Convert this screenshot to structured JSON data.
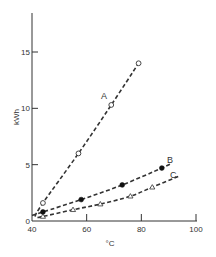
{
  "chart_data": {
    "type": "line",
    "title": "",
    "xlabel": "°C",
    "ylabel": "kWh",
    "xlim": [
      40,
      100
    ],
    "ylim": [
      0,
      18
    ],
    "xticks": [
      40,
      60,
      80,
      100
    ],
    "yticks": [
      0,
      5,
      10,
      15
    ],
    "grid": false,
    "legend": "inline labels at line ends",
    "series": [
      {
        "name": "A",
        "marker": "open-circle",
        "line_style": "dashed",
        "x": [
          44,
          57,
          69,
          79
        ],
        "y": [
          1.6,
          6.0,
          10.3,
          14.0
        ],
        "curve_x": [
          41,
          44,
          57,
          69,
          79
        ],
        "curve_y": [
          0.4,
          1.6,
          6.0,
          10.3,
          14.0
        ]
      },
      {
        "name": "B",
        "marker": "filled-circle",
        "line_style": "dashed",
        "x": [
          44,
          58,
          73,
          87.5
        ],
        "y": [
          0.8,
          1.9,
          3.2,
          4.7
        ],
        "curve_x": [
          40,
          44,
          58,
          73,
          87.5,
          91
        ],
        "curve_y": [
          0.5,
          0.8,
          1.9,
          3.2,
          4.7,
          5.1
        ]
      },
      {
        "name": "C",
        "marker": "open-triangle",
        "line_style": "dashed",
        "x": [
          44,
          55,
          65,
          76,
          84
        ],
        "y": [
          0.4,
          1.0,
          1.5,
          2.2,
          3.0
        ],
        "curve_x": [
          42,
          44,
          55,
          65,
          76,
          84,
          94
        ],
        "curve_y": [
          0.3,
          0.4,
          1.0,
          1.5,
          2.2,
          3.0,
          4.0
        ]
      }
    ]
  },
  "labels": {
    "x_axis": "°C",
    "y_axis": "kWh",
    "series_A": "A",
    "series_B": "B",
    "series_C": "C",
    "x_ticks": [
      "40",
      "60",
      "80",
      "100"
    ],
    "y_ticks": [
      "0",
      "5",
      "10",
      "15"
    ]
  },
  "colors": {
    "ink": "#333333",
    "background": "#ffffff"
  }
}
